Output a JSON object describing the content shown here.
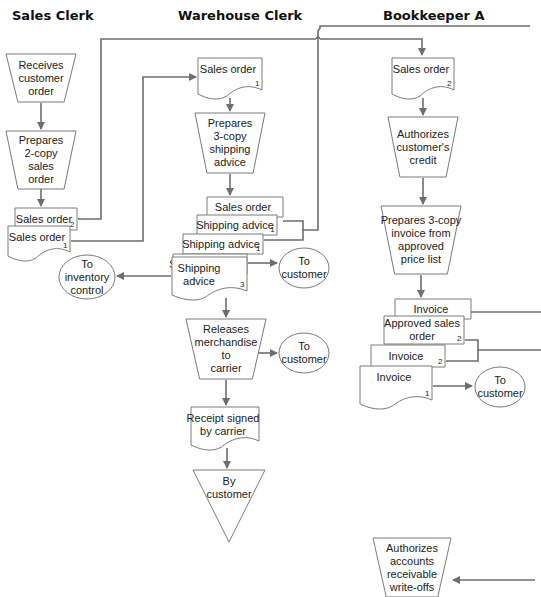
{
  "lanes": [
    {
      "title": "Sales Clerk",
      "x": 12,
      "y": 20
    },
    {
      "title": "Warehouse Clerk",
      "x": 178,
      "y": 20
    },
    {
      "title": "Bookkeeper A",
      "x": 383,
      "y": 20
    }
  ],
  "manual_ops": [
    {
      "id": "receives-customer-order",
      "lines": [
        "Receives",
        "customer",
        "order"
      ],
      "x": 6,
      "y": 54,
      "w": 70,
      "h": 48
    },
    {
      "id": "prepares-2-copy-sales-order",
      "lines": [
        "Prepares",
        "2-copy",
        "sales",
        "order"
      ],
      "x": 6,
      "y": 131,
      "w": 70,
      "h": 58
    },
    {
      "id": "prepares-3-copy-shipping-advice",
      "lines": [
        "Prepares",
        "3-copy",
        "shipping",
        "advice"
      ],
      "x": 195,
      "y": 113,
      "w": 70,
      "h": 60
    },
    {
      "id": "releases-merchandise-to-carrier",
      "lines": [
        "Releases",
        "merchandise",
        "to",
        "carrier"
      ],
      "x": 186,
      "y": 319,
      "w": 80,
      "h": 60
    },
    {
      "id": "authorizes-customers-credit",
      "lines": [
        "Authorizes",
        "customer's",
        "credit"
      ],
      "x": 388,
      "y": 117,
      "w": 70,
      "h": 60
    },
    {
      "id": "prepares-3-copy-invoice",
      "lines": [
        "Prepares 3-copy",
        "invoice from",
        "approved",
        "price list"
      ],
      "x": 381,
      "y": 206,
      "w": 80,
      "h": 68
    },
    {
      "id": "authorizes-ar-write-offs",
      "lines": [
        "Authorizes",
        "accounts",
        "receivable",
        "write-offs"
      ],
      "x": 373,
      "y": 538,
      "w": 78,
      "h": 59
    }
  ],
  "documents": [
    {
      "id": "sales-order-2-sales-clerk",
      "label": "Sales order",
      "num": "2",
      "x": 15,
      "y": 208,
      "w": 62,
      "h": 22,
      "wave": false
    },
    {
      "id": "sales-order-1-sales-clerk",
      "label": "Sales order",
      "num": "1",
      "x": 8,
      "y": 226,
      "w": 62,
      "h": 32,
      "wave": true
    },
    {
      "id": "sales-order-1-warehouse",
      "label": "Sales order",
      "num": "1",
      "x": 198,
      "y": 58,
      "w": 64,
      "h": 38,
      "wave": true
    },
    {
      "id": "sales-order-3-warehouse",
      "label": "Sales order",
      "num": "",
      "x": 207,
      "y": 197,
      "w": 76,
      "h": 20,
      "wave": false
    },
    {
      "id": "shipping-advice-1a",
      "label": "Shipping advice",
      "num": "1",
      "x": 197,
      "y": 215,
      "w": 80,
      "h": 20,
      "wave": false
    },
    {
      "id": "shipping-advice-1b",
      "label": "Shipping advice",
      "num": "1",
      "x": 183,
      "y": 234,
      "w": 80,
      "h": 20,
      "wave": false
    },
    {
      "id": "shipping-advice-2",
      "label": "Shipping advice",
      "num": "2",
      "x": 173,
      "y": 254,
      "w": 74,
      "h": 20,
      "wave": false
    },
    {
      "id": "shipping-advice-3",
      "label": "Shipping advice",
      "label_lines": [
        "Shipping",
        "advice"
      ],
      "num": "3",
      "x": 172,
      "y": 257,
      "w": 75,
      "h": 40,
      "wave": true
    },
    {
      "id": "receipt-signed-by-carrier",
      "label": "Receipt signed by carrier",
      "label_lines": [
        "Receipt signed",
        "by carrier"
      ],
      "num": "",
      "x": 191,
      "y": 407,
      "w": 68,
      "h": 40,
      "wave": true
    },
    {
      "id": "sales-order-2-bookkeeper",
      "label": "Sales order",
      "num": "2",
      "x": 392,
      "y": 58,
      "w": 62,
      "h": 38,
      "wave": true
    },
    {
      "id": "invoice-3",
      "label": "Invoice",
      "num": "",
      "x": 395,
      "y": 299,
      "w": 76,
      "h": 20,
      "wave": false
    },
    {
      "id": "approved-sales-order-2",
      "label": "Approved sales order",
      "label_lines": [
        "Approved sales",
        "order"
      ],
      "num": "2",
      "x": 384,
      "y": 316,
      "w": 80,
      "h": 28,
      "wave": false
    },
    {
      "id": "invoice-2",
      "label": "Invoice",
      "num": "2",
      "x": 371,
      "y": 345,
      "w": 74,
      "h": 22,
      "wave": false
    },
    {
      "id": "invoice-1",
      "label": "Invoice",
      "num": "1",
      "x": 360,
      "y": 366,
      "w": 72,
      "h": 40,
      "wave": true
    }
  ],
  "doc_side_numbers": [
    {
      "num": "3",
      "x": 466,
      "y": 324
    },
    {
      "num": "1",
      "x": 273,
      "y": 228
    },
    {
      "num": "1",
      "x": 271,
      "y": 233
    }
  ],
  "terminals": [
    {
      "id": "to-inventory-control",
      "lines": [
        "To",
        "inventory",
        "control"
      ],
      "cx": 87,
      "cy": 277,
      "rx": 28,
      "ry": 22
    },
    {
      "id": "to-customer-shipping",
      "lines": [
        "To",
        "customer"
      ],
      "cx": 304,
      "cy": 268,
      "rx": 25,
      "ry": 20
    },
    {
      "id": "to-customer-release",
      "lines": [
        "To",
        "customer"
      ],
      "cx": 304,
      "cy": 353,
      "rx": 25,
      "ry": 20
    },
    {
      "id": "to-customer-invoice",
      "lines": [
        "To",
        "customer"
      ],
      "cx": 500,
      "cy": 387,
      "rx": 25,
      "ry": 20
    }
  ],
  "off_page": [
    {
      "id": "by-customer-file",
      "lines": [
        "By",
        "customer"
      ],
      "x": 193,
      "y": 470,
      "w": 72,
      "h": 72
    }
  ],
  "top_caption_fragment": "",
  "colors": {
    "line": "#6e6e6e",
    "shape_stroke": "#7a7a7a",
    "text": "#222222",
    "background": "#ffffff"
  }
}
